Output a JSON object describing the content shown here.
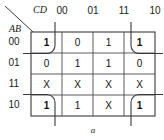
{
  "diagram": {
    "type": "karnaugh-map",
    "title": "",
    "column_variable_label": "CD",
    "row_variable_label": "AB",
    "column_headers": [
      "00",
      "01",
      "11",
      "10"
    ],
    "row_headers": [
      "00",
      "01",
      "11",
      "10"
    ],
    "bottom_label": "a",
    "colors": {
      "grid": "#4a4a4a",
      "text": "#111111",
      "loop": "#3a3a3a",
      "background": "#ffffff"
    },
    "cells": [
      [
        "1",
        "0",
        "1",
        "1"
      ],
      [
        "0",
        "1",
        "1",
        "0"
      ],
      [
        "X",
        "X",
        "X",
        "X"
      ],
      [
        "1",
        "1",
        "X",
        "1"
      ]
    ],
    "cell_emphasis": [
      [
        true,
        false,
        false,
        true
      ],
      [
        false,
        false,
        false,
        false
      ],
      [
        false,
        false,
        false,
        false
      ],
      [
        true,
        false,
        false,
        true
      ]
    ],
    "groups": [
      {
        "name": "corner-loop-top-left",
        "row": 0,
        "col": 0
      },
      {
        "name": "corner-loop-top-right",
        "row": 0,
        "col": 3
      },
      {
        "name": "corner-loop-bottom-left",
        "row": 3,
        "col": 0
      },
      {
        "name": "corner-loop-bottom-right",
        "row": 3,
        "col": 3
      }
    ]
  }
}
